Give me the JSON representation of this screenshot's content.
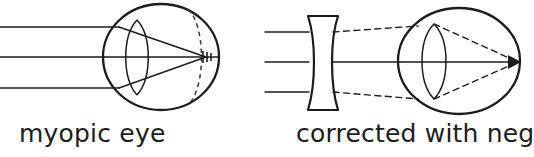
{
  "figure": {
    "background_color": "#ffffff",
    "ink_color": "#1c1c1c",
    "width": 524,
    "height": 157
  },
  "panels": [
    {
      "id": "left",
      "caption": "myopic eye",
      "description": "Uncorrected myopic eye: three parallel incoming rays are focused by the cornea and crystalline lens to a point in front of the retina.",
      "elements": {
        "eyeball": "solid-circle",
        "crystalline_lens": "biconvex-lens",
        "retina": "dashed-arc",
        "incoming_rays": 3,
        "ray_style": "solid",
        "focal_point": "inside-eye-in-front-of-retina"
      }
    },
    {
      "id": "right",
      "caption": "corrected with neg",
      "caption_truncated": true,
      "description": "Myopic eye corrected with a diverging (negative) lens: rays diverge through the concave lens and then focus on the retina at the back of the eye.",
      "elements": {
        "correcting_lens": "biconcave-negative-lens",
        "eyeball": "solid-circle",
        "crystalline_lens": "biconvex-lens",
        "incoming_rays": 3,
        "ray_style_before_lens": "solid",
        "ray_style_after_lens": "dashed",
        "focal_point": "on-retina-at-back-of-eye"
      }
    }
  ],
  "rays": {
    "y_positions": [
      27,
      57,
      88
    ],
    "count": 3,
    "label": "parallel incoming light rays"
  }
}
